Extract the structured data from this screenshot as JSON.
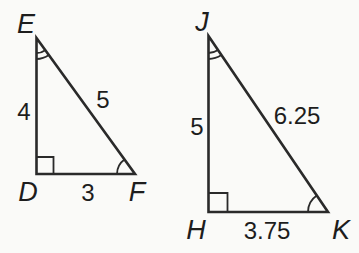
{
  "canvas": {
    "width": 359,
    "height": 253,
    "background": "#fafaf8",
    "stroke_color": "#2a2a2a",
    "stroke_width": 2.6,
    "mark_stroke_width": 1.8,
    "text_color": "#1d1d1d"
  },
  "triangles": [
    {
      "id": "DEF",
      "vertices": [
        {
          "name": "E",
          "x": 36.5,
          "y": 38,
          "label_x": 26,
          "label_y": 24,
          "mark": {
            "type": "arcs",
            "radii": [
              15,
              21
            ]
          }
        },
        {
          "name": "D",
          "x": 36.5,
          "y": 174,
          "label_x": 28,
          "label_y": 192,
          "mark": {
            "type": "right-angle",
            "size": 17
          }
        },
        {
          "name": "F",
          "x": 135,
          "y": 174,
          "label_x": 137,
          "label_y": 192,
          "mark": {
            "type": "arcs",
            "radii": [
              18
            ]
          }
        }
      ],
      "sides": [
        {
          "from": "E",
          "to": "D",
          "label": "4",
          "label_x": 24,
          "label_y": 111
        },
        {
          "from": "E",
          "to": "F",
          "label": "5",
          "label_x": 103,
          "label_y": 99
        },
        {
          "from": "D",
          "to": "F",
          "label": "3",
          "label_x": 88,
          "label_y": 192
        }
      ]
    },
    {
      "id": "JHK",
      "vertices": [
        {
          "name": "J",
          "x": 208.5,
          "y": 36,
          "label_x": 202,
          "label_y": 22,
          "mark": {
            "type": "arcs",
            "radii": [
              17,
              23
            ]
          }
        },
        {
          "name": "H",
          "x": 208.5,
          "y": 212,
          "label_x": 196,
          "label_y": 230,
          "mark": {
            "type": "right-angle",
            "size": 19
          }
        },
        {
          "name": "K",
          "x": 328,
          "y": 212,
          "label_x": 341,
          "label_y": 230,
          "mark": {
            "type": "arcs",
            "radii": [
              20
            ]
          }
        }
      ],
      "sides": [
        {
          "from": "J",
          "to": "H",
          "label": "5",
          "label_x": 197,
          "label_y": 126
        },
        {
          "from": "J",
          "to": "K",
          "label": "6.25",
          "label_x": 297,
          "label_y": 115
        },
        {
          "from": "H",
          "to": "K",
          "label": "3.75",
          "label_x": 267,
          "label_y": 230
        }
      ]
    }
  ]
}
